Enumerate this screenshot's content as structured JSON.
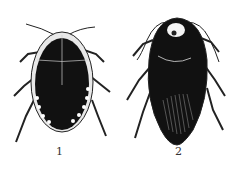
{
  "figures": [
    {
      "label": "1",
      "description": "insect specimen, rounded oval body with pale spotted margin"
    },
    {
      "label": "2",
      "description": "insect specimen, elongated oval body with pale pronotum spot and hatched wings"
    }
  ],
  "colors": {
    "ink": "#111111",
    "paper": "#ffffff",
    "pale": "#e8e8e8"
  }
}
